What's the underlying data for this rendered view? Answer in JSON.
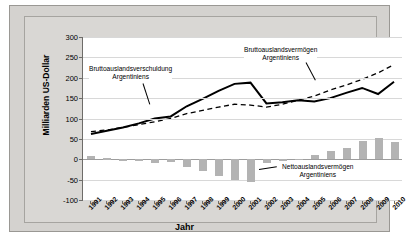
{
  "chart_data": {
    "type": "line",
    "title": "",
    "xlabel": "Jahr",
    "ylabel": "Milliarden US-Dollar",
    "ylim": [
      -100,
      300
    ],
    "yticks": [
      -100,
      -50,
      0,
      50,
      100,
      150,
      200,
      250,
      300
    ],
    "grid": true,
    "legend_position": "annotations-inline",
    "categories": [
      "1991",
      "1992",
      "1993",
      "1994",
      "1995",
      "1996",
      "1997",
      "1998",
      "1999",
      "2000",
      "2001",
      "2002",
      "2003",
      "2004",
      "2005",
      "2006",
      "2007",
      "2008",
      "2009",
      "2010"
    ],
    "series": [
      {
        "name": "Bruttoauslandsverschuldung Argentiniens",
        "style": "solid-line",
        "color": "#000000",
        "values": [
          62,
          70,
          78,
          88,
          100,
          105,
          130,
          148,
          168,
          185,
          188,
          137,
          140,
          145,
          142,
          150,
          163,
          175,
          160,
          190
        ]
      },
      {
        "name": "Bruttoauslandsvermögen Argentiniens",
        "style": "dashed-line",
        "color": "#000000",
        "values": [
          68,
          72,
          78,
          85,
          92,
          100,
          112,
          120,
          128,
          135,
          133,
          128,
          135,
          145,
          155,
          170,
          182,
          196,
          212,
          232
        ]
      },
      {
        "name": "Nettoauslandsvermögen Argentiniens",
        "style": "bars",
        "color": "#b3b3b3",
        "values": [
          8,
          3,
          -1,
          -4,
          -9,
          -6,
          -19,
          -29,
          -41,
          -51,
          -55,
          -9,
          -5,
          1,
          11,
          21,
          28,
          45,
          52,
          42
        ]
      }
    ],
    "annotations": [
      {
        "id": "debt",
        "text_line1": "Bruttoauslandsverschuldung",
        "text_line2": "Argentiniens"
      },
      {
        "id": "assets",
        "text_line1": "Bruttoauslandsvermögen",
        "text_line2": "Argentiniens"
      },
      {
        "id": "net",
        "text_line1": "Nettoauslandsvermögen",
        "text_line2": "Argentiniens"
      }
    ]
  }
}
